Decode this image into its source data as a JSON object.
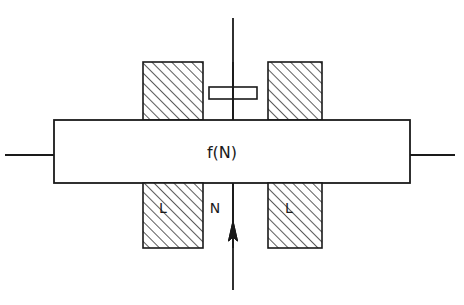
{
  "diagram": {
    "canvas": {
      "width": 464,
      "height": 305,
      "background": "#ffffff"
    },
    "colors": {
      "stroke": "#1a1a1a",
      "fill": "#ffffff",
      "hatch": "#333333"
    },
    "labels": {
      "force_bar": "f(N)",
      "left_block_upper": "",
      "left_block_lower": "L",
      "center_column_lower": "N",
      "right_block_lower": "L"
    },
    "parts": [
      {
        "name": "upper-left-hatched-block",
        "x": 143,
        "y": 62,
        "width": 60,
        "height": 58,
        "hatched": true
      },
      {
        "name": "upper-center-column",
        "x": 203,
        "y": 62,
        "width": 65,
        "height": 58,
        "hatched": false
      },
      {
        "name": "upper-right-hatched-block",
        "x": 268,
        "y": 62,
        "width": 54,
        "height": 58,
        "hatched": true
      },
      {
        "name": "piston-plate",
        "x": 209,
        "y": 87,
        "width": 48,
        "height": 12,
        "hatched": false
      },
      {
        "name": "force-bar",
        "x": 54,
        "y": 120,
        "width": 356,
        "height": 63,
        "hatched": false
      },
      {
        "name": "lower-left-hatched-block",
        "x": 143,
        "y": 183,
        "width": 60,
        "height": 65,
        "hatched": true
      },
      {
        "name": "lower-center-column",
        "x": 203,
        "y": 183,
        "width": 65,
        "height": 65,
        "hatched": false
      },
      {
        "name": "lower-right-hatched-block",
        "x": 268,
        "y": 183,
        "width": 54,
        "height": 65,
        "hatched": true
      }
    ],
    "axis": {
      "name": "vertical-center-axis",
      "x": 233,
      "y_top": 18,
      "y_bottom": 290,
      "arrow_tip_y": 222,
      "arrow_base_y": 241,
      "arrow_direction": "up"
    },
    "leads": [
      {
        "name": "left-lead",
        "x1": 5,
        "y1": 155,
        "x2": 54,
        "y2": 155
      },
      {
        "name": "right-lead",
        "x1": 410,
        "y1": 155,
        "x2": 455,
        "y2": 155
      }
    ],
    "label_positions": {
      "force_bar": {
        "x": 222,
        "y": 158
      },
      "left_block_lower": {
        "x": 163,
        "y": 213
      },
      "center_column_lower": {
        "x": 215,
        "y": 213
      },
      "right_block_lower": {
        "x": 289,
        "y": 213
      }
    }
  }
}
